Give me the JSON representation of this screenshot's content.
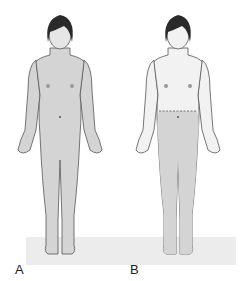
{
  "figure": {
    "panels": [
      {
        "label": "A",
        "shading": "full-body"
      },
      {
        "label": "B",
        "shading": "lower-body-below-waist"
      }
    ],
    "colors": {
      "skin_shaded": "#d4d4d4",
      "skin_unshaded": "#f2f2f2",
      "outline": "#555555",
      "hair": "#2a2a2a",
      "floor": "#ececec"
    }
  }
}
